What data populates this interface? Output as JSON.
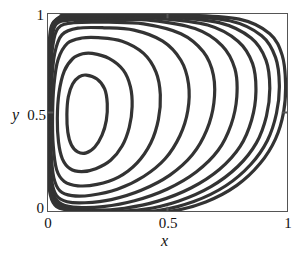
{
  "figure": {
    "name": "lid-driven-cavity-streamlines",
    "background_color": "#ffffff",
    "frame_color": "#555555",
    "contour_color": "#333333"
  },
  "axes": {
    "x_title": "x",
    "y_title": "y",
    "x_ticks": [
      "0",
      "0.5",
      "1"
    ],
    "y_ticks": [
      "0",
      "0.5",
      "1"
    ],
    "x_tick_values": [
      0,
      0.5,
      1
    ],
    "y_tick_values": [
      0,
      0.5,
      1
    ]
  },
  "chart_data": {
    "type": "line",
    "subtype": "contour-streamlines",
    "title": "",
    "xlabel": "x",
    "ylabel": "y",
    "xlim": [
      0,
      1
    ],
    "ylim": [
      0,
      1
    ],
    "xticks": [
      0,
      0.5,
      1
    ],
    "yticks": [
      0,
      0.5,
      1
    ],
    "xticklabels": [
      "0",
      "0.5",
      "1"
    ],
    "yticklabels": [
      "0",
      "0.5",
      "1"
    ],
    "grid": false,
    "legend": null,
    "annotations": [],
    "n_contours": 10,
    "vortex_center": [
      0.16,
      0.49
    ],
    "series": [
      {
        "name": "contour-1-innermost",
        "closed": true,
        "points": [
          [
            0.16,
            0.69
          ],
          [
            0.205,
            0.67
          ],
          [
            0.237,
            0.62
          ],
          [
            0.248,
            0.545
          ],
          [
            0.244,
            0.46
          ],
          [
            0.226,
            0.385
          ],
          [
            0.196,
            0.325
          ],
          [
            0.16,
            0.295
          ],
          [
            0.124,
            0.3
          ],
          [
            0.098,
            0.335
          ],
          [
            0.083,
            0.4
          ],
          [
            0.079,
            0.49
          ],
          [
            0.085,
            0.58
          ],
          [
            0.103,
            0.645
          ],
          [
            0.13,
            0.681
          ]
        ]
      },
      {
        "name": "contour-2",
        "closed": true,
        "points": [
          [
            0.185,
            0.8
          ],
          [
            0.255,
            0.775
          ],
          [
            0.315,
            0.715
          ],
          [
            0.345,
            0.63
          ],
          [
            0.352,
            0.53
          ],
          [
            0.34,
            0.425
          ],
          [
            0.31,
            0.33
          ],
          [
            0.262,
            0.258
          ],
          [
            0.2,
            0.215
          ],
          [
            0.14,
            0.2
          ],
          [
            0.092,
            0.215
          ],
          [
            0.06,
            0.265
          ],
          [
            0.044,
            0.35
          ],
          [
            0.039,
            0.47
          ],
          [
            0.046,
            0.6
          ],
          [
            0.068,
            0.71
          ],
          [
            0.104,
            0.774
          ],
          [
            0.145,
            0.798
          ]
        ]
      },
      {
        "name": "contour-3",
        "closed": true,
        "points": [
          [
            0.21,
            0.88
          ],
          [
            0.31,
            0.862
          ],
          [
            0.4,
            0.8
          ],
          [
            0.452,
            0.705
          ],
          [
            0.47,
            0.59
          ],
          [
            0.462,
            0.465
          ],
          [
            0.43,
            0.345
          ],
          [
            0.372,
            0.243
          ],
          [
            0.295,
            0.172
          ],
          [
            0.205,
            0.135
          ],
          [
            0.125,
            0.128
          ],
          [
            0.068,
            0.15
          ],
          [
            0.036,
            0.21
          ],
          [
            0.022,
            0.33
          ],
          [
            0.019,
            0.48
          ],
          [
            0.025,
            0.64
          ],
          [
            0.042,
            0.768
          ],
          [
            0.082,
            0.852
          ],
          [
            0.142,
            0.878
          ]
        ]
      },
      {
        "name": "contour-4",
        "closed": true,
        "points": [
          [
            0.235,
            0.93
          ],
          [
            0.36,
            0.918
          ],
          [
            0.48,
            0.862
          ],
          [
            0.556,
            0.765
          ],
          [
            0.588,
            0.645
          ],
          [
            0.585,
            0.51
          ],
          [
            0.552,
            0.382
          ],
          [
            0.49,
            0.265
          ],
          [
            0.4,
            0.175
          ],
          [
            0.29,
            0.11
          ],
          [
            0.18,
            0.08
          ],
          [
            0.1,
            0.078
          ],
          [
            0.05,
            0.102
          ],
          [
            0.024,
            0.17
          ],
          [
            0.013,
            0.3
          ],
          [
            0.011,
            0.47
          ],
          [
            0.015,
            0.65
          ],
          [
            0.028,
            0.8
          ],
          [
            0.058,
            0.894
          ],
          [
            0.125,
            0.928
          ]
        ]
      },
      {
        "name": "contour-5",
        "closed": true,
        "points": [
          [
            0.255,
            0.958
          ],
          [
            0.4,
            0.95
          ],
          [
            0.556,
            0.9
          ],
          [
            0.65,
            0.808
          ],
          [
            0.692,
            0.69
          ],
          [
            0.694,
            0.548
          ],
          [
            0.664,
            0.41
          ],
          [
            0.604,
            0.285
          ],
          [
            0.51,
            0.182
          ],
          [
            0.39,
            0.105
          ],
          [
            0.265,
            0.058
          ],
          [
            0.155,
            0.042
          ],
          [
            0.08,
            0.047
          ],
          [
            0.036,
            0.078
          ],
          [
            0.016,
            0.15
          ],
          [
            0.008,
            0.29
          ],
          [
            0.007,
            0.47
          ],
          [
            0.01,
            0.67
          ],
          [
            0.019,
            0.83
          ],
          [
            0.042,
            0.928
          ],
          [
            0.11,
            0.956
          ]
        ]
      },
      {
        "name": "contour-6",
        "closed": true,
        "points": [
          [
            0.27,
            0.972
          ],
          [
            0.43,
            0.968
          ],
          [
            0.615,
            0.926
          ],
          [
            0.728,
            0.84
          ],
          [
            0.782,
            0.722
          ],
          [
            0.79,
            0.58
          ],
          [
            0.766,
            0.438
          ],
          [
            0.712,
            0.308
          ],
          [
            0.62,
            0.198
          ],
          [
            0.5,
            0.112
          ],
          [
            0.362,
            0.052
          ],
          [
            0.23,
            0.022
          ],
          [
            0.125,
            0.018
          ],
          [
            0.058,
            0.035
          ],
          [
            0.024,
            0.08
          ],
          [
            0.009,
            0.18
          ],
          [
            0.005,
            0.34
          ],
          [
            0.004,
            0.52
          ],
          [
            0.008,
            0.712
          ],
          [
            0.016,
            0.862
          ],
          [
            0.034,
            0.948
          ],
          [
            0.1,
            0.97
          ]
        ]
      },
      {
        "name": "contour-7",
        "closed": true,
        "points": [
          [
            0.282,
            0.981
          ],
          [
            0.46,
            0.978
          ],
          [
            0.668,
            0.944
          ],
          [
            0.795,
            0.862
          ],
          [
            0.856,
            0.748
          ],
          [
            0.87,
            0.606
          ],
          [
            0.852,
            0.462
          ],
          [
            0.804,
            0.328
          ],
          [
            0.718,
            0.212
          ],
          [
            0.6,
            0.118
          ],
          [
            0.46,
            0.05
          ],
          [
            0.32,
            0.014
          ],
          [
            0.19,
            0.004
          ],
          [
            0.092,
            0.012
          ],
          [
            0.038,
            0.04
          ],
          [
            0.014,
            0.105
          ],
          [
            0.004,
            0.23
          ],
          [
            0.002,
            0.42
          ],
          [
            0.003,
            0.63
          ],
          [
            0.008,
            0.81
          ],
          [
            0.02,
            0.925
          ],
          [
            0.05,
            0.972
          ],
          [
            0.095,
            0.98
          ]
        ]
      },
      {
        "name": "contour-8",
        "closed": true,
        "points": [
          [
            0.292,
            0.987
          ],
          [
            0.49,
            0.985
          ],
          [
            0.716,
            0.956
          ],
          [
            0.85,
            0.878
          ],
          [
            0.912,
            0.766
          ],
          [
            0.928,
            0.625
          ],
          [
            0.914,
            0.482
          ],
          [
            0.872,
            0.346
          ],
          [
            0.794,
            0.226
          ],
          [
            0.682,
            0.124
          ],
          [
            0.545,
            0.05
          ],
          [
            0.4,
            0.008
          ],
          [
            0.258,
            -0.002
          ],
          [
            0.14,
            0.002
          ],
          [
            0.062,
            0.018
          ],
          [
            0.022,
            0.062
          ],
          [
            0.006,
            0.16
          ],
          [
            0.001,
            0.33
          ],
          [
            0.001,
            0.54
          ],
          [
            0.004,
            0.742
          ],
          [
            0.012,
            0.89
          ],
          [
            0.032,
            0.966
          ],
          [
            0.09,
            0.986
          ]
        ]
      },
      {
        "name": "contour-9",
        "closed": true,
        "points": [
          [
            0.3,
            0.992
          ],
          [
            0.52,
            0.991
          ],
          [
            0.76,
            0.966
          ],
          [
            0.894,
            0.89
          ],
          [
            0.952,
            0.78
          ],
          [
            0.968,
            0.64
          ],
          [
            0.956,
            0.496
          ],
          [
            0.918,
            0.358
          ],
          [
            0.848,
            0.236
          ],
          [
            0.744,
            0.128
          ],
          [
            0.61,
            0.048
          ],
          [
            0.46,
            0.002
          ],
          [
            0.31,
            -0.004
          ],
          [
            0.175,
            -0.002
          ],
          [
            0.08,
            0.008
          ],
          [
            0.03,
            0.038
          ],
          [
            0.008,
            0.11
          ],
          [
            0.0,
            0.26
          ],
          [
            0.0,
            0.47
          ],
          [
            0.002,
            0.68
          ],
          [
            0.007,
            0.85
          ],
          [
            0.02,
            0.95
          ],
          [
            0.06,
            0.986
          ],
          [
            0.086,
            0.991
          ]
        ]
      },
      {
        "name": "contour-10-outermost",
        "closed": true,
        "points": [
          [
            0.306,
            0.996
          ],
          [
            0.56,
            0.995
          ],
          [
            0.8,
            0.974
          ],
          [
            0.928,
            0.9
          ],
          [
            0.98,
            0.79
          ],
          [
            0.994,
            0.648
          ],
          [
            0.986,
            0.504
          ],
          [
            0.952,
            0.366
          ],
          [
            0.888,
            0.242
          ],
          [
            0.79,
            0.13
          ],
          [
            0.66,
            0.046
          ],
          [
            0.51,
            -0.002
          ],
          [
            0.35,
            -0.008
          ],
          [
            0.205,
            -0.006
          ],
          [
            0.098,
            0.002
          ],
          [
            0.036,
            0.022
          ],
          [
            0.01,
            0.08
          ],
          [
            0.0,
            0.21
          ],
          [
            0.0,
            0.42
          ],
          [
            0.0,
            0.64
          ],
          [
            0.004,
            0.82
          ],
          [
            0.014,
            0.938
          ],
          [
            0.05,
            0.986
          ],
          [
            0.082,
            0.994
          ]
        ]
      }
    ]
  }
}
